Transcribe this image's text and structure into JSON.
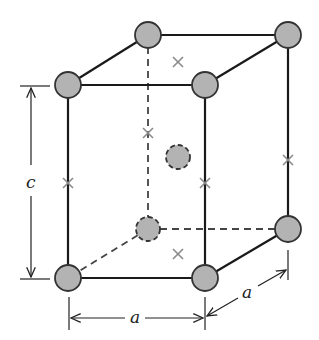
{
  "diagram": {
    "type": "body-centered tetragonal unit cell",
    "labels": {
      "height": "c",
      "width": "a",
      "depth": "a"
    },
    "colors": {
      "atom_fill": "#b3b3b3",
      "atom_stroke": "#333333",
      "edge": "#1a1a1a",
      "cross": "#8a8a8a"
    },
    "atoms": {
      "corners": [
        {
          "id": "front-top-left",
          "x": 68,
          "y": 85
        },
        {
          "id": "front-top-right",
          "x": 205,
          "y": 85
        },
        {
          "id": "front-bottom-left",
          "x": 68,
          "y": 278
        },
        {
          "id": "front-bottom-right",
          "x": 205,
          "y": 278
        },
        {
          "id": "back-top-left",
          "x": 148,
          "y": 35
        },
        {
          "id": "back-top-right",
          "x": 288,
          "y": 35
        },
        {
          "id": "back-bottom-left",
          "x": 148,
          "y": 229
        },
        {
          "id": "back-bottom-right",
          "x": 288,
          "y": 229
        }
      ],
      "center": {
        "id": "body-center",
        "x": 178,
        "y": 157
      }
    },
    "crosses": [
      {
        "x": 178,
        "y": 62
      },
      {
        "x": 148,
        "y": 133
      },
      {
        "x": 68,
        "y": 183
      },
      {
        "x": 205,
        "y": 183
      },
      {
        "x": 288,
        "y": 160
      },
      {
        "x": 178,
        "y": 254
      }
    ]
  }
}
